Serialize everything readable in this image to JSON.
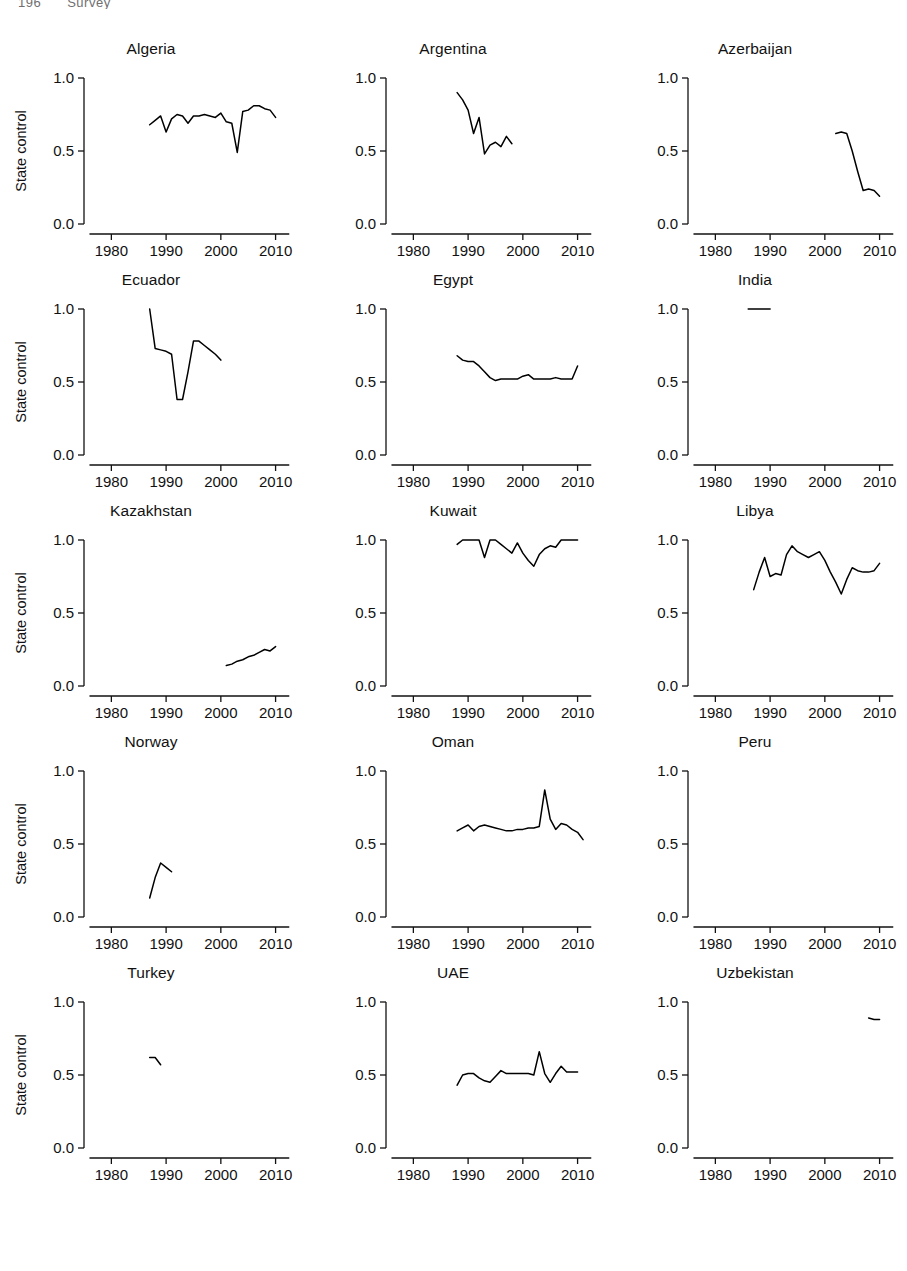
{
  "header": {
    "page_number": "196",
    "running_head": "Survey"
  },
  "axis": {
    "ylabel": "State control",
    "xlabel": "Year",
    "yticks": [
      "0.0",
      "0.5",
      "1.0"
    ],
    "xticks": [
      "1980",
      "1990",
      "2000",
      "2010"
    ]
  },
  "chart_data": {
    "type": "line",
    "xlabel": "Year",
    "ylabel": "State control",
    "xlim": [
      1975,
      2013
    ],
    "ylim": [
      0.0,
      1.0
    ],
    "yticks": [
      0.0,
      0.5,
      1.0
    ],
    "xticks": [
      1980,
      1990,
      2000,
      2010
    ],
    "grid": false,
    "legend": "none",
    "layout": {
      "rows": 5,
      "cols": 3
    },
    "line_color": "#000000",
    "panels": [
      {
        "name": "Algeria",
        "x": [
          1987,
          1988,
          1989,
          1990,
          1991,
          1992,
          1993,
          1994,
          1995,
          1996,
          1997,
          1998,
          1999,
          2000,
          2001,
          2002,
          2003,
          2004,
          2005,
          2006,
          2007,
          2008,
          2009,
          2010
        ],
        "y": [
          0.68,
          0.71,
          0.74,
          0.63,
          0.72,
          0.75,
          0.74,
          0.69,
          0.74,
          0.74,
          0.75,
          0.74,
          0.73,
          0.76,
          0.7,
          0.69,
          0.49,
          0.77,
          0.78,
          0.81,
          0.81,
          0.79,
          0.78,
          0.73
        ]
      },
      {
        "name": "Argentina",
        "x": [
          1988,
          1989,
          1990,
          1991,
          1992,
          1993,
          1994,
          1995,
          1996,
          1997,
          1998
        ],
        "y": [
          0.9,
          0.85,
          0.78,
          0.62,
          0.73,
          0.48,
          0.54,
          0.56,
          0.53,
          0.6,
          0.55
        ]
      },
      {
        "name": "Azerbaijan",
        "x": [
          2002,
          2003,
          2004,
          2005,
          2006,
          2007,
          2008,
          2009,
          2010
        ],
        "y": [
          0.62,
          0.63,
          0.62,
          0.5,
          0.36,
          0.23,
          0.24,
          0.23,
          0.19
        ]
      },
      {
        "name": "Ecuador",
        "x": [
          1987,
          1988,
          1989,
          1990,
          1991,
          1992,
          1993,
          1994,
          1995,
          1996,
          1997,
          1998,
          1999,
          2000
        ],
        "y": [
          1.0,
          0.73,
          0.72,
          0.71,
          0.69,
          0.38,
          0.38,
          0.57,
          0.78,
          0.78,
          0.75,
          0.72,
          0.69,
          0.65
        ]
      },
      {
        "name": "Egypt",
        "x": [
          1988,
          1989,
          1990,
          1991,
          1992,
          1993,
          1994,
          1995,
          1996,
          1997,
          1998,
          1999,
          2000,
          2001,
          2002,
          2003,
          2004,
          2005,
          2006,
          2007,
          2008,
          2009,
          2010
        ],
        "y": [
          0.68,
          0.65,
          0.64,
          0.64,
          0.61,
          0.57,
          0.53,
          0.51,
          0.52,
          0.52,
          0.52,
          0.52,
          0.54,
          0.55,
          0.52,
          0.52,
          0.52,
          0.52,
          0.53,
          0.52,
          0.52,
          0.52,
          0.61
        ]
      },
      {
        "name": "India",
        "x": [
          1986,
          1987,
          1988,
          1989,
          1990
        ],
        "y": [
          1.0,
          1.0,
          1.0,
          1.0,
          1.0
        ]
      },
      {
        "name": "Kazakhstan",
        "x": [
          2001,
          2002,
          2003,
          2004,
          2005,
          2006,
          2007,
          2008,
          2009,
          2010
        ],
        "y": [
          0.14,
          0.15,
          0.17,
          0.18,
          0.2,
          0.21,
          0.23,
          0.25,
          0.24,
          0.27
        ]
      },
      {
        "name": "Kuwait",
        "x": [
          1988,
          1989,
          1990,
          1991,
          1992,
          1993,
          1994,
          1995,
          1996,
          1997,
          1998,
          1999,
          2000,
          2001,
          2002,
          2003,
          2004,
          2005,
          2006,
          2007,
          2008,
          2009,
          2010
        ],
        "y": [
          0.97,
          1.0,
          1.0,
          1.0,
          1.0,
          0.88,
          1.0,
          1.0,
          0.97,
          0.94,
          0.91,
          0.98,
          0.91,
          0.86,
          0.82,
          0.9,
          0.94,
          0.96,
          0.95,
          1.0,
          1.0,
          1.0,
          1.0
        ]
      },
      {
        "name": "Libya",
        "x": [
          1987,
          1988,
          1989,
          1990,
          1991,
          1992,
          1993,
          1994,
          1995,
          1996,
          1997,
          1998,
          1999,
          2000,
          2001,
          2002,
          2003,
          2004,
          2005,
          2006,
          2007,
          2008,
          2009,
          2010
        ],
        "y": [
          0.66,
          0.78,
          0.88,
          0.75,
          0.77,
          0.76,
          0.9,
          0.96,
          0.92,
          0.9,
          0.88,
          0.9,
          0.92,
          0.86,
          0.78,
          0.71,
          0.63,
          0.73,
          0.81,
          0.79,
          0.78,
          0.78,
          0.79,
          0.84
        ]
      },
      {
        "name": "Norway",
        "x": [
          1987,
          1988,
          1989,
          1990,
          1991
        ],
        "y": [
          0.13,
          0.27,
          0.37,
          0.34,
          0.31
        ]
      },
      {
        "name": "Oman",
        "x": [
          1988,
          1989,
          1990,
          1991,
          1992,
          1993,
          1994,
          1995,
          1996,
          1997,
          1998,
          1999,
          2000,
          2001,
          2002,
          2003,
          2004,
          2005,
          2006,
          2007,
          2008,
          2009,
          2010,
          2011
        ],
        "y": [
          0.59,
          0.61,
          0.63,
          0.59,
          0.62,
          0.63,
          0.62,
          0.61,
          0.6,
          0.59,
          0.59,
          0.6,
          0.6,
          0.61,
          0.61,
          0.62,
          0.87,
          0.67,
          0.6,
          0.64,
          0.63,
          0.6,
          0.58,
          0.53
        ]
      },
      {
        "name": "Peru",
        "x": [],
        "y": []
      },
      {
        "name": "Turkey",
        "x": [
          1987,
          1988,
          1989
        ],
        "y": [
          0.62,
          0.62,
          0.57
        ]
      },
      {
        "name": "UAE",
        "x": [
          1988,
          1989,
          1990,
          1991,
          1992,
          1993,
          1994,
          1995,
          1996,
          1997,
          1998,
          1999,
          2000,
          2001,
          2002,
          2003,
          2004,
          2005,
          2006,
          2007,
          2008,
          2009,
          2010
        ],
        "y": [
          0.43,
          0.5,
          0.51,
          0.51,
          0.48,
          0.46,
          0.45,
          0.49,
          0.53,
          0.51,
          0.51,
          0.51,
          0.51,
          0.51,
          0.5,
          0.66,
          0.51,
          0.45,
          0.51,
          0.56,
          0.52,
          0.52,
          0.52
        ]
      },
      {
        "name": "Uzbekistan",
        "x": [
          2008,
          2009,
          2010
        ],
        "y": [
          0.89,
          0.88,
          0.88
        ]
      }
    ]
  }
}
